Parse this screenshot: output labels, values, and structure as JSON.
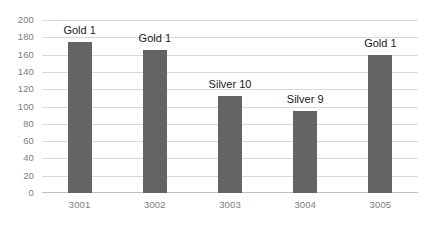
{
  "chart_data": {
    "type": "bar",
    "title": "",
    "subtitle": "",
    "xlabel": "",
    "ylabel": "",
    "categories": [
      "3001",
      "3002",
      "3003",
      "3004",
      "3005"
    ],
    "values": [
      175,
      165,
      112,
      95,
      160
    ],
    "point_labels": [
      "Gold 1",
      "Gold 1",
      "Silver 10",
      "Silver 9",
      "Gold 1"
    ],
    "ylim": [
      0,
      200
    ],
    "ytick_step": 20,
    "yticks": [
      "200",
      "180",
      "160",
      "140",
      "120",
      "100",
      "80",
      "60",
      "40",
      "20",
      "0"
    ],
    "grid": "horizontal",
    "legend": "none",
    "series": [
      {
        "name": "Series 1",
        "values": [
          175,
          165,
          112,
          95,
          160
        ],
        "color": "#646464"
      }
    ],
    "colors": {
      "bar": "#646464",
      "gridline": "#d9d9d9",
      "baseline": "#bfbfbf",
      "tick_text": "#7d7d7d",
      "label_text": "#1a1a1a",
      "background": "#ffffff"
    }
  }
}
